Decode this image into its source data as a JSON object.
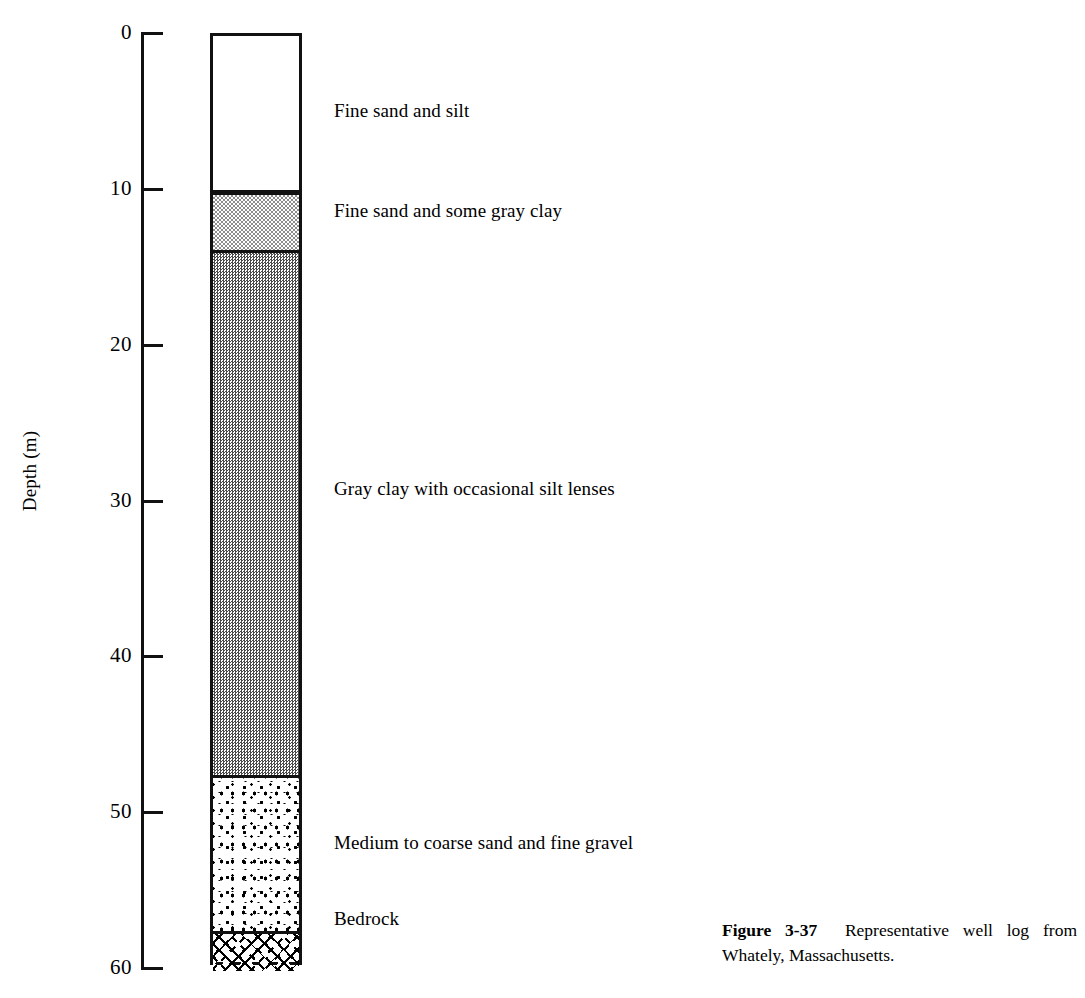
{
  "figure": {
    "axis": {
      "title": "Depth (m)",
      "unit": "m",
      "ticks": [
        {
          "value": "0",
          "depth": 0
        },
        {
          "value": "10",
          "depth": 10
        },
        {
          "value": "20",
          "depth": 20
        },
        {
          "value": "30",
          "depth": 30
        },
        {
          "value": "40",
          "depth": 40
        },
        {
          "value": "50",
          "depth": 50
        },
        {
          "value": "60",
          "depth": 60
        }
      ],
      "range": [
        0,
        60
      ]
    },
    "layers": [
      {
        "label": "Fine sand and silt",
        "top_depth": 0,
        "bottom_depth": 10,
        "pattern": "blank"
      },
      {
        "label": "Fine sand and some gray clay",
        "top_depth": 10,
        "bottom_depth": 13.8,
        "pattern": "light-stipple"
      },
      {
        "label": "Gray clay with occasional silt lenses",
        "top_depth": 13.8,
        "bottom_depth": 47.5,
        "pattern": "dense-stipple"
      },
      {
        "label": "Medium to coarse sand and fine gravel",
        "top_depth": 47.5,
        "bottom_depth": 57.5,
        "pattern": "coarse-blocks"
      },
      {
        "label": "Bedrock",
        "top_depth": 57.5,
        "bottom_depth": 60,
        "pattern": "cross-hatch-dashes"
      }
    ],
    "caption": {
      "number": "Figure 3-37",
      "text": "Representative well log from Whately, Massachusetts."
    },
    "colors": {
      "ink": "#000000",
      "background": "#ffffff"
    }
  },
  "chart_data": {
    "type": "table",
    "title": "Representative well log from Whately, Massachusetts",
    "ylabel": "Depth (m)",
    "ylim": [
      0,
      60
    ],
    "tick_labels": [
      "0",
      "10",
      "20",
      "30",
      "40",
      "50",
      "60"
    ],
    "categories": [
      "Fine sand and silt",
      "Fine sand and some gray clay",
      "Gray clay with occasional silt lenses",
      "Medium to coarse sand and fine gravel",
      "Bedrock"
    ],
    "top_depths": [
      0,
      10,
      13.8,
      47.5,
      57.5
    ],
    "bottom_depths": [
      10,
      13.8,
      47.5,
      57.5,
      60
    ],
    "thicknesses": [
      10,
      3.8,
      33.7,
      10,
      2.5
    ],
    "grid": false,
    "legend": "none"
  }
}
